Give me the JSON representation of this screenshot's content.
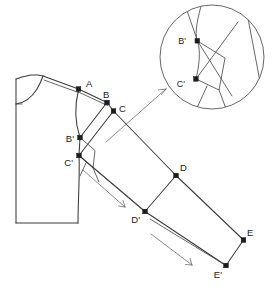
{
  "figure": {
    "kind": "technical-line-drawing",
    "background_color": "#ffffff",
    "line_color": "#3a3a3c",
    "point_color": "#1c1c1e",
    "canvas": {
      "width": 273,
      "height": 287
    }
  },
  "labels": {
    "A": "A",
    "B": "B",
    "B_prime": "B'",
    "C": "C",
    "C_prime": "C'",
    "D": "D",
    "D_prime": "D'",
    "E": "E",
    "E_prime": "E'",
    "zoom_B_prime": "B'",
    "zoom_C_prime": "C'"
  },
  "points": {
    "A": {
      "x": 78.5,
      "y": 89.0,
      "label": "A",
      "label_x": 85,
      "label_y": 86
    },
    "B": {
      "x": 107.0,
      "y": 102.5,
      "label": "B",
      "label_x": 104,
      "label_y": 98
    },
    "C": {
      "x": 113.5,
      "y": 111.0,
      "label": "C",
      "label_x": 119,
      "label_y": 110
    },
    "B_prime": {
      "x": 80.0,
      "y": 137.5,
      "label": "B'",
      "label_x": 69,
      "label_y": 143
    },
    "C_prime": {
      "x": 79.0,
      "y": 155.5,
      "label": "C'",
      "label_x": 66,
      "label_y": 164
    },
    "D": {
      "x": 176.0,
      "y": 175.5,
      "label": "D",
      "label_x": 179,
      "label_y": 170
    },
    "D_prime": {
      "x": 145.0,
      "y": 211.5,
      "label": "D'",
      "label_x": 133,
      "label_y": 221
    },
    "E": {
      "x": 243.5,
      "y": 240.0,
      "label": "E",
      "label_x": 246,
      "label_y": 235
    },
    "E_prime": {
      "x": 226.0,
      "y": 265.5,
      "label": "E'",
      "label_x": 212,
      "label_y": 276
    }
  },
  "zoom_inset": {
    "shape": "circle",
    "center_x": 212,
    "center_y": 57,
    "radius": 52,
    "points": {
      "B_prime": {
        "x": 197.5,
        "y": 41.0,
        "label": "B'",
        "label_x": 189,
        "label_y": 44
      },
      "C_prime": {
        "x": 196.0,
        "y": 79.0,
        "label": "C'",
        "label_x": 186,
        "label_y": 87
      }
    },
    "leader_from": {
      "x": 106,
      "y": 142
    },
    "leader_to": {
      "x": 166,
      "y": 89
    }
  },
  "arrows": [
    {
      "name": "upper-shift-arrow",
      "x1": 83,
      "y1": 170,
      "x2": 129,
      "y2": 211
    },
    {
      "name": "lower-shift-arrow",
      "x1": 151,
      "y1": 234,
      "x2": 196,
      "y2": 268
    }
  ],
  "bodice": {
    "name": "front-bodice-outline",
    "left_edge_x": 16,
    "top_y": 78,
    "bottom_y": 223,
    "shoulder_apex": {
      "x": 43,
      "y": 76
    },
    "hem_right_x": 78
  },
  "sleeve": {
    "name": "sleeve-panel",
    "upper_seam": [
      "C",
      "D",
      "E"
    ],
    "lower_seam": [
      "C_prime",
      "D_prime",
      "E_prime"
    ],
    "cross_lines": [
      [
        "D",
        "D_prime"
      ],
      [
        "E",
        "E_prime"
      ]
    ]
  }
}
